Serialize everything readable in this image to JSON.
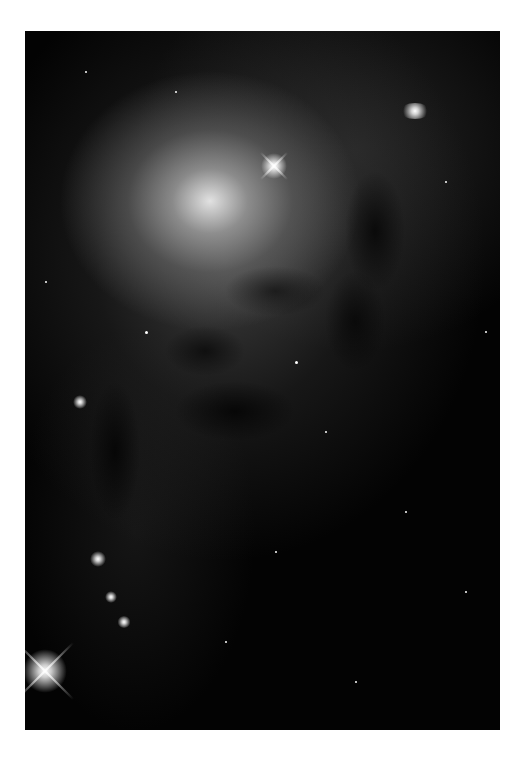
{
  "photo": {
    "subject": "spiral galaxy core with dust lanes",
    "palette": {
      "background": "#ffffff",
      "sky": "#030303",
      "core": "#ebebeb"
    }
  }
}
